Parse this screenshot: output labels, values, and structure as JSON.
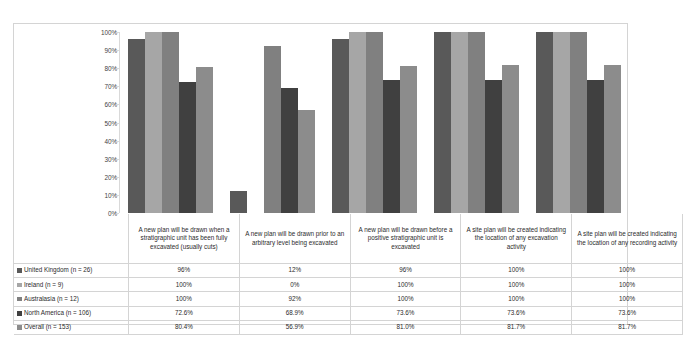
{
  "chart_data": {
    "type": "bar",
    "title": "",
    "subtitle": "",
    "xlabel": "",
    "ylabel": "",
    "ylim": [
      0,
      100
    ],
    "grid": false,
    "legend_position": "bottom-table",
    "y_ticks": [
      "0%",
      "10%",
      "20%",
      "30%",
      "40%",
      "50%",
      "60%",
      "70%",
      "80%",
      "90%",
      "100%"
    ],
    "y_tick_values": [
      0,
      10,
      20,
      30,
      40,
      50,
      60,
      70,
      80,
      90,
      100
    ],
    "categories": [
      "A new plan will be drawn when a stratigraphic unit has been fully excavated (usually cuts)",
      "A new plan will be drawn prior to an arbitrary level being excavated",
      "A new plan will be drawn before a positive stratigraphic unit is excavated",
      "A site plan will be created indicating the location of any excavation activity",
      "A site plan will be created indicating the location of any recording activity"
    ],
    "series": [
      {
        "name": "United Kingdom (n = 26)",
        "color": "#595959",
        "values": [
          96,
          12,
          96,
          100,
          100
        ],
        "labels": [
          "96%",
          "12%",
          "96%",
          "100%",
          "100%"
        ]
      },
      {
        "name": "Ireland (n = 9)",
        "color": "#a6a6a6",
        "values": [
          100,
          0,
          100,
          100,
          100
        ],
        "labels": [
          "100%",
          "0%",
          "100%",
          "100%",
          "100%"
        ]
      },
      {
        "name": "Australasia (n = 12)",
        "color": "#808080",
        "values": [
          100,
          92,
          100,
          100,
          100
        ],
        "labels": [
          "100%",
          "92%",
          "100%",
          "100%",
          "100%"
        ]
      },
      {
        "name": "North America (n = 106)",
        "color": "#404040",
        "values": [
          72.6,
          68.9,
          73.6,
          73.6,
          73.6
        ],
        "labels": [
          "72.6%",
          "68.9%",
          "73.6%",
          "73.6%",
          "73.6%"
        ]
      },
      {
        "name": "Overall (n = 153)",
        "color": "#8c8c8c",
        "values": [
          80.4,
          56.9,
          81.0,
          81.7,
          81.7
        ],
        "labels": [
          "80.4%",
          "56.9%",
          "81.0%",
          "81.7%",
          "81.7%"
        ]
      }
    ]
  }
}
